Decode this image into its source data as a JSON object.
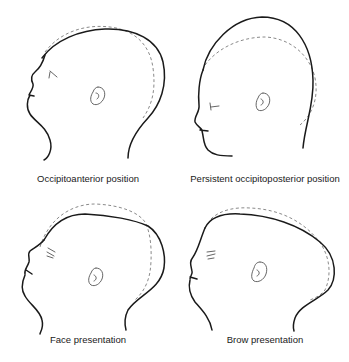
{
  "figure": {
    "panels": [
      {
        "id": "occipitoanterior",
        "label": "Occipitoanterior position"
      },
      {
        "id": "persistent-occipitoposterior",
        "label": "Persistent occipitoposterior position"
      },
      {
        "id": "face",
        "label": "Face presentation"
      },
      {
        "id": "brow",
        "label": "Brow presentation"
      }
    ],
    "legend_styles": {
      "solid_outline": "head outline (solid)",
      "dashed_outline": "comparison outline (dashed)"
    },
    "colors": {
      "solid_line": "#1a1a1a",
      "dashed_line": "#8a8a8a",
      "background": "#ffffff"
    }
  }
}
